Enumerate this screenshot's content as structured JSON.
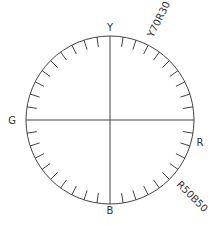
{
  "diagram": {
    "type": "ncs-color-circle",
    "center": [
      110,
      120
    ],
    "radius": 84,
    "divisions": 40,
    "tick_length": 10,
    "stroke_color": "#444444",
    "label_color": "#333333",
    "elementary_colors": [
      {
        "key": "Y",
        "label": "Y",
        "angle_deg": 0
      },
      {
        "key": "R",
        "label": "R",
        "angle_deg": 90
      },
      {
        "key": "B",
        "label": "B",
        "angle_deg": 180
      },
      {
        "key": "G",
        "label": "G",
        "angle_deg": 270
      }
    ],
    "hue_annotations": [
      {
        "label": "Y70R30",
        "angle_deg": 27
      },
      {
        "label": "R50B50",
        "angle_deg": 135
      }
    ]
  }
}
